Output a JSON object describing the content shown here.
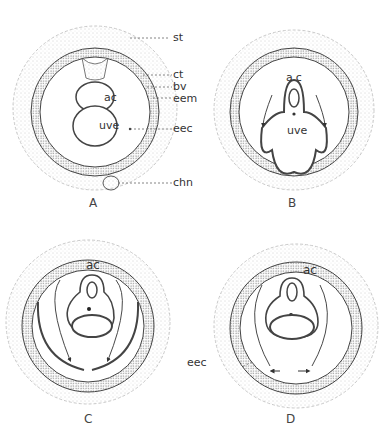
{
  "figure": {
    "panels": [
      {
        "id": "A",
        "letter": "A",
        "inner_labels": [
          "ac",
          "uve"
        ],
        "callouts": [
          "st",
          "ct",
          "bv",
          "eem",
          "eec",
          "chn"
        ]
      },
      {
        "id": "B",
        "letter": "B",
        "inner_labels": [
          "ac",
          "uve"
        ]
      },
      {
        "id": "C",
        "letter": "C",
        "inner_labels": [
          "ac"
        ]
      },
      {
        "id": "D",
        "letter": "D",
        "inner_labels": [
          "ac"
        ],
        "callouts": [
          "eec"
        ]
      }
    ]
  },
  "colors": {
    "ink": "#333333",
    "stipple": "#9a9a9a",
    "background": "#ffffff"
  }
}
